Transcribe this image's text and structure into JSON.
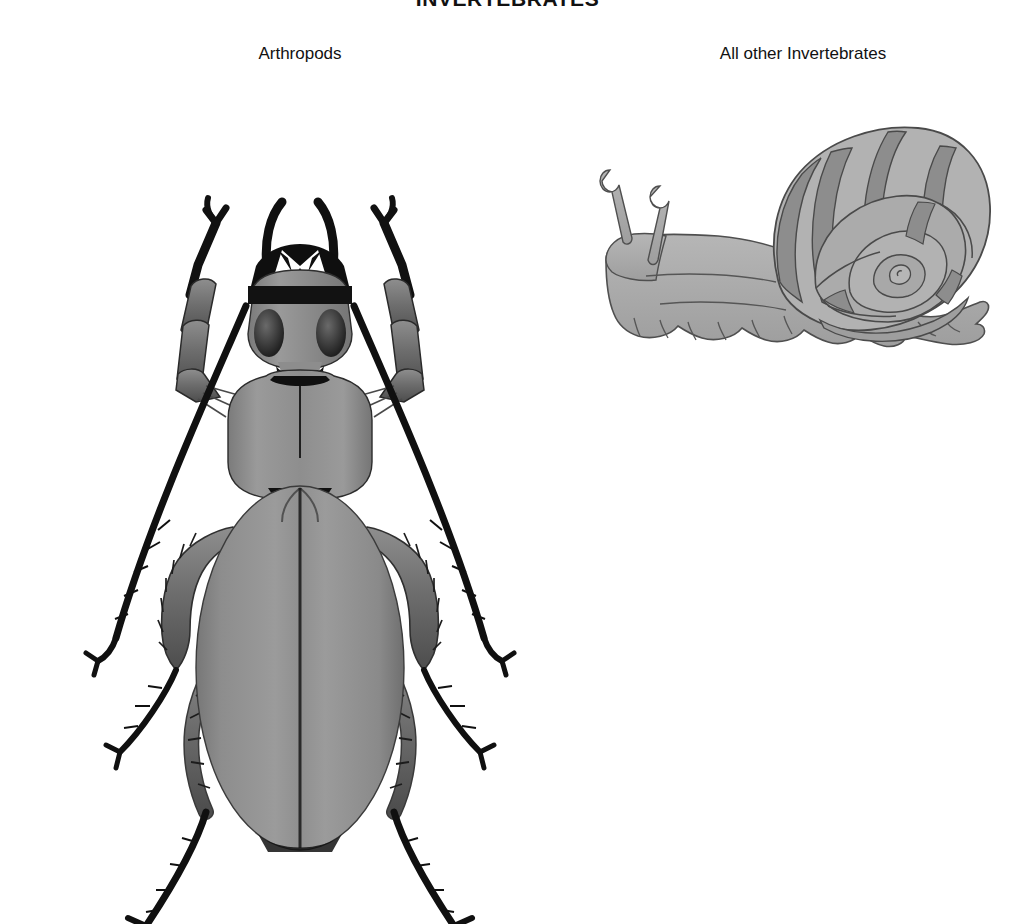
{
  "page": {
    "background_color": "#ffffff",
    "title": "INVERTEBRATES",
    "title_clipped_at_top": true
  },
  "headings": {
    "main_title": "INVERTEBRATES",
    "left_label": "Arthropods",
    "right_label": "All other Invertebrates"
  },
  "figures": [
    {
      "name": "beetle",
      "caption": "Arthropods",
      "subject": "ground beetle (Carabidae), dorsal view",
      "colors": {
        "body_gray": "#8a8a8a",
        "body_light": "#a4a4a4",
        "body_shadow": "#6d6d6d",
        "leg_gray": "#6f6f6f",
        "outline_black": "#101010"
      },
      "parts": [
        "mandibles",
        "antennae",
        "compound eyes",
        "pronotum",
        "elytra",
        "elytral suture",
        "front legs",
        "middle legs",
        "hind legs",
        "tarsal claws",
        "leg spines"
      ]
    },
    {
      "name": "snail",
      "caption": "All other Invertebrates",
      "subject": "land snail (Gastropoda), lateral view",
      "colors": {
        "body_gray": "#a8a8a8",
        "shell_light": "#b4b4b4",
        "shell_band": "#8d8d8d",
        "outline": "#4a4a4a"
      },
      "parts": [
        "shell",
        "shell spiral whorls",
        "shell bands",
        "muscular foot",
        "head",
        "upper tentacles with eyes",
        "lower tentacles"
      ]
    }
  ]
}
